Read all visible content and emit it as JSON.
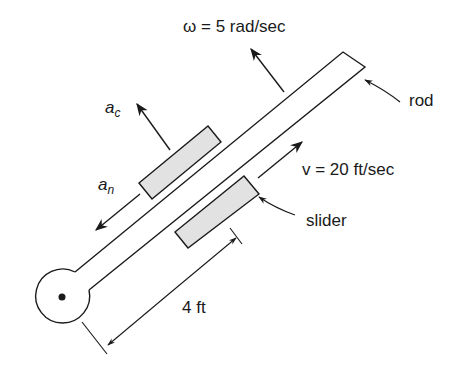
{
  "diagram": {
    "labels": {
      "omega": "ω = 5 rad/sec",
      "rod": "rod",
      "velocity": "v = 20 ft/sec",
      "slider": "slider",
      "distance": "4 ft",
      "ac_main": "a",
      "ac_sub": "c",
      "an_main": "a",
      "an_sub": "n"
    },
    "colors": {
      "stroke": "#1a1a1a",
      "slider_fill": "#e2e2e2",
      "background": "#ffffff"
    }
  }
}
